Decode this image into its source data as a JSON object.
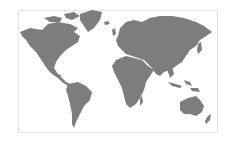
{
  "map": {
    "title": "World map",
    "land_color": "#7d7d7d",
    "background_color": "#ffffff",
    "border_color": "#e4e4e4",
    "regions": [
      "North America",
      "Greenland",
      "South America",
      "Europe",
      "Africa",
      "Asia",
      "Australia",
      "New Zealand",
      "Indonesia",
      "Japan",
      "Madagascar",
      "United Kingdom",
      "Iceland"
    ]
  }
}
